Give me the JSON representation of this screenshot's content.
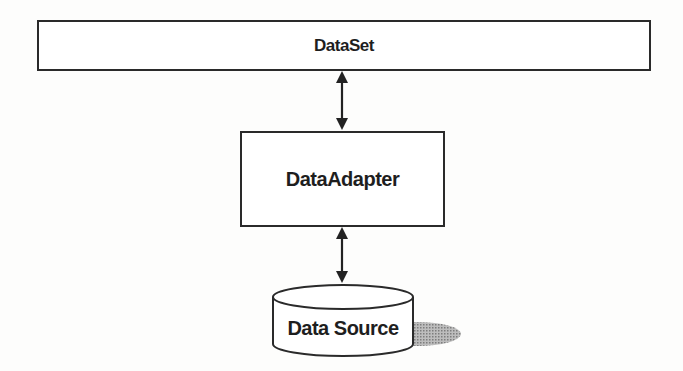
{
  "diagram": {
    "nodes": [
      {
        "id": "dataset",
        "label": "DataSet",
        "shape": "rectangle"
      },
      {
        "id": "adapter",
        "label": "DataAdapter",
        "shape": "rectangle"
      },
      {
        "id": "source",
        "label": "Data Source",
        "shape": "cylinder"
      }
    ],
    "edges": [
      {
        "from": "dataset",
        "to": "adapter",
        "type": "bidirectional-arrow"
      },
      {
        "from": "adapter",
        "to": "source",
        "type": "bidirectional-arrow"
      }
    ],
    "colors": {
      "stroke": "#2a2a2a",
      "shadow": "#9a9a9a",
      "background": "#fdfdfc"
    }
  }
}
